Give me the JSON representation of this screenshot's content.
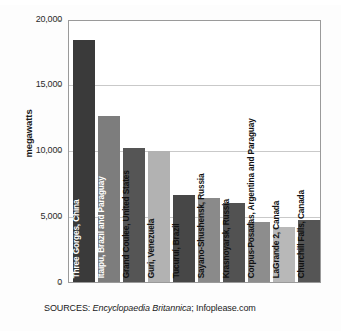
{
  "chart_data": {
    "type": "bar",
    "title": "",
    "xlabel": "",
    "ylabel": "megawatts",
    "ylim": [
      0,
      20000
    ],
    "yticks": [
      0,
      5000,
      10000,
      15000,
      20000
    ],
    "ytick_labels": [
      "0",
      "5,000",
      "10,000",
      "15,000",
      "20,000"
    ],
    "grid": true,
    "legend": "none",
    "categories": [
      "Three Gorges, China",
      "Itaipu, Brazil and Paraguay",
      "Grand Coulee, United States",
      "Guri, Venezuela",
      "Tucuruí, Brazil",
      "Sayano-Shushensk, Russia",
      "Krasnoyarsk, Russia",
      "Corpus-Posadas, Argentina and Paraguay",
      "LaGrande 2, Canada",
      "Churchill Falls, Canada"
    ],
    "values": [
      18400,
      12600,
      10200,
      10000,
      6600,
      6400,
      6000,
      4600,
      4200,
      4700
    ],
    "bar_colors": [
      "#3a3a3a",
      "#7d7d7d",
      "#555555",
      "#b2b2b2",
      "#474747",
      "#8a8a8a",
      "#525252",
      "#8d8d8d",
      "#b8b8b8",
      "#555555"
    ],
    "label_text_colors": [
      "light",
      "light",
      "dark",
      "dark",
      "dark",
      "dark",
      "dark",
      "dark",
      "dark",
      "dark"
    ]
  },
  "footer": {
    "sources_prefix": "SOURCES: ",
    "source_italic": "Encyclopaedia Britannica",
    "source_rest": "; Infoplease.com"
  }
}
